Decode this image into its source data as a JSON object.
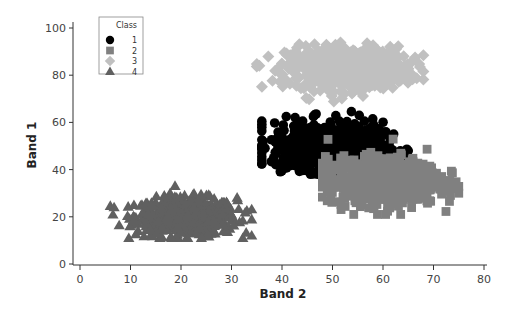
{
  "chart_data": {
    "type": "scatter",
    "title": "",
    "xlabel": "Band 2",
    "ylabel": "Band 1",
    "xlim": [
      0,
      80
    ],
    "ylim": [
      0,
      100
    ],
    "xticks": [
      0,
      10,
      20,
      30,
      40,
      50,
      60,
      70,
      80
    ],
    "yticks": [
      0,
      20,
      40,
      60,
      80,
      100
    ],
    "grid": false,
    "legend": {
      "title": "Class",
      "position": "upper-left",
      "entries": [
        "1",
        "2",
        "3",
        "4"
      ]
    },
    "series": [
      {
        "name": "1",
        "marker": "circle",
        "color": "#000000",
        "center": [
          49,
          50
        ],
        "std": [
          5.5,
          5
        ],
        "range_x": [
          36,
          65
        ],
        "range_y": [
          38,
          65
        ],
        "count": 700
      },
      {
        "name": "2",
        "marker": "square",
        "color": "#808080",
        "center": [
          60,
          35
        ],
        "std": [
          5.5,
          5
        ],
        "range_x": [
          48,
          75
        ],
        "range_y": [
          21,
          54
        ],
        "count": 700
      },
      {
        "name": "3",
        "marker": "diamond",
        "color": "#c0c0c0",
        "center": [
          53,
          83
        ],
        "std": [
          6,
          4.5
        ],
        "range_x": [
          35,
          68
        ],
        "range_y": [
          68,
          99
        ],
        "count": 600
      },
      {
        "name": "4",
        "marker": "triangle",
        "color": "#606060",
        "center": [
          21,
          20
        ],
        "std": [
          5,
          4
        ],
        "range_x": [
          6,
          34
        ],
        "range_y": [
          11,
          37
        ],
        "count": 600
      }
    ]
  }
}
